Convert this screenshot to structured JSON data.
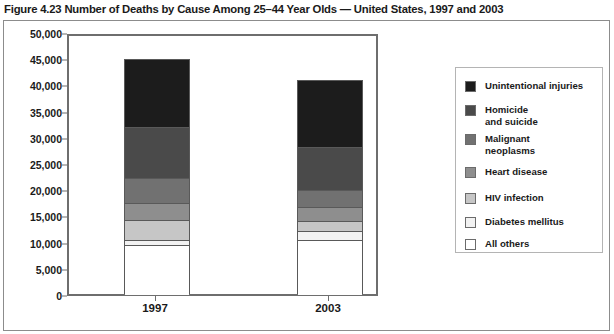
{
  "title": "Figure 4.23 Number of Deaths by Cause Among 25–44 Year Olds — United States, 1997 and 2003",
  "legend": {
    "items": [
      {
        "label": "Unintentional injuries",
        "color": "#1c1c1c"
      },
      {
        "label": "Homicide\nand suicide",
        "color": "#4a4a4a"
      },
      {
        "label": "Malignant\nneoplasms",
        "color": "#717171"
      },
      {
        "label": "Heart disease",
        "color": "#8e8e8e"
      },
      {
        "label": "HIV infection",
        "color": "#c6c6c6"
      },
      {
        "label": "Diabetes mellitus",
        "color": "#f2f2f2"
      },
      {
        "label": "All others",
        "color": "#ffffff"
      }
    ]
  },
  "axis": {
    "yticks": [
      "50,000",
      "45,000",
      "40,000",
      "35,000",
      "30,000",
      "25,000",
      "20,000",
      "15,000",
      "10,000",
      "5,000",
      "0"
    ],
    "xticks": [
      "1997",
      "2003"
    ]
  },
  "chart_data": {
    "type": "bar",
    "subtype": "stacked-column",
    "title": "Figure 4.23 Number of Deaths by Cause Among 25–44 Year Olds — United States, 1997 and 2003",
    "xlabel": "",
    "ylabel": "",
    "ylim": [
      0,
      50000
    ],
    "ytick_interval": 5000,
    "grid": false,
    "legend_position": "right",
    "categories": [
      "1997",
      "2003"
    ],
    "series": [
      {
        "name": "All others",
        "color": "#ffffff",
        "values": [
          9540,
          10500
        ]
      },
      {
        "name": "Diabetes mellitus",
        "color": "#f2f2f2",
        "values": [
          950,
          1720
        ]
      },
      {
        "name": "HIV infection",
        "color": "#c6c6c6",
        "values": [
          3815,
          1910
        ]
      },
      {
        "name": "Heart disease",
        "color": "#8e8e8e",
        "values": [
          3245,
          2670
        ]
      },
      {
        "name": "Malignant neoplasms",
        "color": "#717171",
        "values": [
          4960,
          3430
        ]
      },
      {
        "name": "Homicide and suicide",
        "color": "#4a4a4a",
        "values": [
          9920,
          8200
        ]
      },
      {
        "name": "Unintentional injuries",
        "color": "#1c1c1c",
        "values": [
          13170,
          12970
        ]
      }
    ],
    "totals": [
      45600,
      41400
    ]
  }
}
